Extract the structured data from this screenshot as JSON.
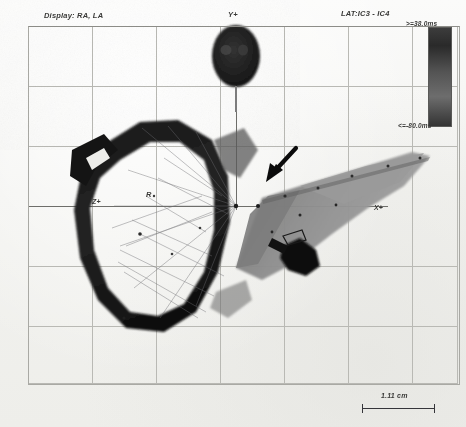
{
  "window": {
    "title": "Electroanatomic Activation Map",
    "modality": "LAT map"
  },
  "header": {
    "display_label": "Display: RA, LA",
    "lat_label": "LAT:IC3 - IC4"
  },
  "colorbar": {
    "max_label": ">=38.0ms",
    "min_label": "<=-80.0ms",
    "max_value": 38.0,
    "min_value": -80.0,
    "units": "ms",
    "color_high": "#3c3c3c",
    "color_mid": "#6d6d6d",
    "color_low": "#343434"
  },
  "axes": {
    "y_label": "Y+",
    "x_label": "X+",
    "z_label": "Z+",
    "origin_label": "R"
  },
  "scale": {
    "length_label": "1.11 cm",
    "value": 1.11,
    "units": "cm"
  },
  "annotations": {
    "arrow": {
      "name": "pointer-arrow",
      "direction": "down-left",
      "tip_x": 268,
      "tip_y": 180
    }
  },
  "structures": [
    {
      "name": "right-atrium-ring",
      "shade": "#1c1c1c",
      "label": "RA"
    },
    {
      "name": "left-atrium-surface",
      "shade": "#8a8a8a",
      "label": "LA"
    },
    {
      "name": "superior-blob",
      "shade": "#242424",
      "label": ""
    },
    {
      "name": "dark-focus-lesion",
      "shade": "#0f0f0f",
      "label": ""
    }
  ],
  "grid": {
    "vertical_x": [
      28,
      92,
      156,
      220,
      284,
      348,
      412,
      457
    ],
    "horizontal_y": [
      26,
      86,
      146,
      206,
      266,
      326,
      383
    ],
    "axis_h_y": 206,
    "axis_v_x": 236,
    "color": "#b9b9b4"
  }
}
